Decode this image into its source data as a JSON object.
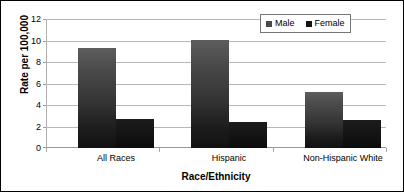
{
  "chart_data": {
    "type": "bar",
    "title": "",
    "xlabel": "Race/Ethnicity",
    "ylabel": "Rate per 100,000",
    "categories": [
      "All Races",
      "Hispanic",
      "Non-Hispanic White"
    ],
    "series": [
      {
        "name": "Male",
        "color": "#4a4a4a",
        "values": [
          9.3,
          10.0,
          5.2
        ]
      },
      {
        "name": "Female",
        "color": "#141414",
        "values": [
          2.7,
          2.4,
          2.6
        ]
      }
    ],
    "ylim": [
      0,
      12
    ],
    "yticks": [
      0,
      2,
      4,
      6,
      8,
      10,
      12
    ],
    "ytick_labels": [
      "0",
      "2",
      "4",
      "6",
      "8",
      "10",
      "12"
    ],
    "grid": true,
    "legend_position": "top-right"
  }
}
